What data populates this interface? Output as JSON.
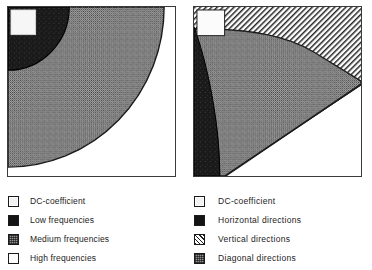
{
  "figure": {
    "panels": [
      {
        "name": "frequency-bands-diagram",
        "regions": [
          {
            "id": "dc-coefficient",
            "fill": "white-box",
            "label": "DC-coefficient"
          },
          {
            "id": "low-frequencies",
            "fill": "black",
            "label": "Low frequencies"
          },
          {
            "id": "medium-frequencies",
            "fill": "gray-dither",
            "label": "Medium frequencies"
          },
          {
            "id": "high-frequencies",
            "fill": "white",
            "label": "High frequencies"
          }
        ]
      },
      {
        "name": "directional-bands-diagram",
        "regions": [
          {
            "id": "dc-coefficient",
            "fill": "white-box",
            "label": "DC-coefficient"
          },
          {
            "id": "horizontal-directions",
            "fill": "black",
            "label": "Horizontal directions"
          },
          {
            "id": "vertical-directions",
            "fill": "hatch",
            "label": "Vertical directions"
          },
          {
            "id": "diagonal-directions",
            "fill": "gray-dither",
            "label": "Diagonal directions"
          }
        ]
      }
    ]
  },
  "legend_left": {
    "title": "Frequency bands",
    "items": [
      {
        "label": "DC-coefficient",
        "swatch": "white-box"
      },
      {
        "label": "Low frequencies",
        "swatch": "black"
      },
      {
        "label": "Medium frequencies",
        "swatch": "gray-dither"
      },
      {
        "label": "High frequencies",
        "swatch": "white"
      }
    ]
  },
  "legend_right": {
    "title": "Directional bands",
    "items": [
      {
        "label": "DC-coefficient",
        "swatch": "white-box"
      },
      {
        "label": "Horizontal directions",
        "swatch": "black"
      },
      {
        "label": "Vertical directions",
        "swatch": "hatch"
      },
      {
        "label": "Diagonal directions",
        "swatch": "gray-dither"
      }
    ]
  },
  "colors": {
    "background": "#ffffff",
    "frame_border": "#3a3a3a",
    "black_region": "#141414",
    "gray_dither_region": "#8f8f8f",
    "white_region": "#ffffff",
    "hatch_line": "#1e1e1e",
    "text": "#1c1c1c"
  }
}
